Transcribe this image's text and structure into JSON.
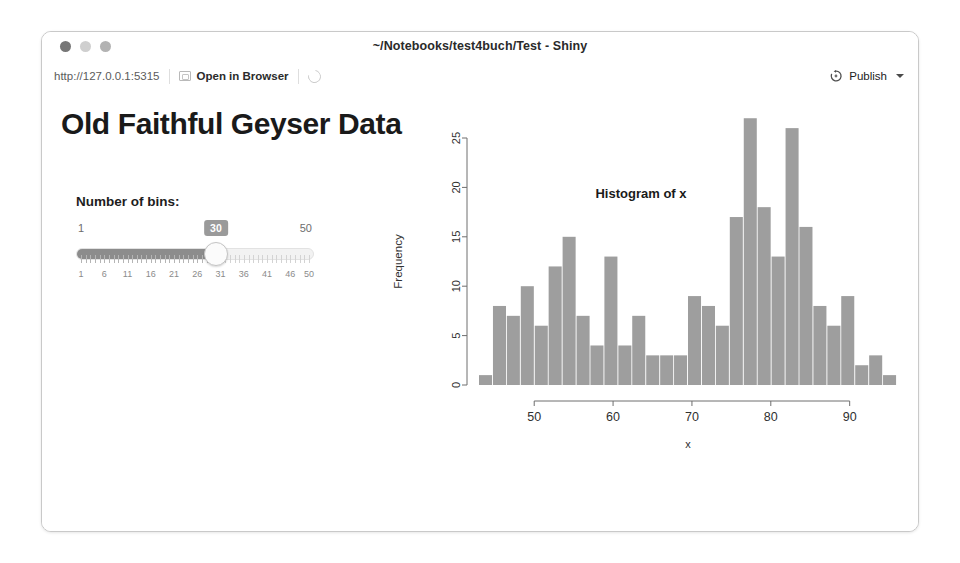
{
  "window": {
    "title": "~/Notebooks/test4buch/Test - Shiny",
    "traffic_lights": [
      "close",
      "minimize",
      "maximize"
    ]
  },
  "toolbar": {
    "url": "http://127.0.0.1:5315",
    "open_in_browser_label": "Open in Browser",
    "refresh_icon": "refresh-icon",
    "publish_label": "Publish",
    "publish_icon": "publish-icon",
    "caret_icon": "chevron-down-icon"
  },
  "app": {
    "title": "Old Faithful Geyser Data",
    "slider": {
      "label": "Number of bins:",
      "value": "30",
      "min": "1",
      "max": "50",
      "tick_labels": [
        "1",
        "6",
        "11",
        "16",
        "21",
        "26",
        "31",
        "36",
        "41",
        "46",
        "50"
      ],
      "fill_color": "#8c8c8c",
      "value_badge_color": "#9a9a9a"
    }
  },
  "chart_data": {
    "type": "bar",
    "title": "Histogram of x",
    "xlabel": "x",
    "ylabel": "Frequency",
    "xlim": [
      43,
      96
    ],
    "ylim": [
      0,
      27
    ],
    "xticks": [
      50,
      60,
      70,
      80,
      90
    ],
    "yticks": [
      0,
      5,
      10,
      15,
      20,
      25
    ],
    "grid": false,
    "legend": null,
    "bar_color": "#9e9e9e",
    "bin_width": 1.7666,
    "bin_starts": [
      43.0,
      44.77,
      46.53,
      48.3,
      50.07,
      51.83,
      53.6,
      55.37,
      57.13,
      58.9,
      60.67,
      62.43,
      64.2,
      65.97,
      67.73,
      69.5,
      71.27,
      73.03,
      74.8,
      76.57,
      78.33,
      80.1,
      81.87,
      83.63,
      85.4,
      87.17,
      88.93,
      90.7,
      92.47,
      94.23
    ],
    "categories": [
      "43.0-44.8",
      "44.8-46.5",
      "46.5-48.3",
      "48.3-50.1",
      "50.1-51.8",
      "51.8-53.6",
      "53.6-55.4",
      "55.4-57.1",
      "57.1-58.9",
      "58.9-60.7",
      "60.7-62.4",
      "62.4-64.2",
      "64.2-66.0",
      "66.0-67.7",
      "67.7-69.5",
      "69.5-71.3",
      "71.3-73.0",
      "73.0-74.8",
      "74.8-76.6",
      "76.6-78.3",
      "78.3-80.1",
      "80.1-81.9",
      "81.9-83.6",
      "83.6-85.4",
      "85.4-87.2",
      "87.2-88.9",
      "88.9-90.7",
      "90.7-92.5",
      "92.5-94.2",
      "94.2-96.0"
    ],
    "values": [
      1,
      8,
      7,
      10,
      6,
      12,
      15,
      7,
      4,
      13,
      4,
      7,
      3,
      3,
      3,
      9,
      8,
      6,
      17,
      27,
      18,
      13,
      26,
      16,
      8,
      6,
      9,
      2,
      3,
      1
    ]
  }
}
